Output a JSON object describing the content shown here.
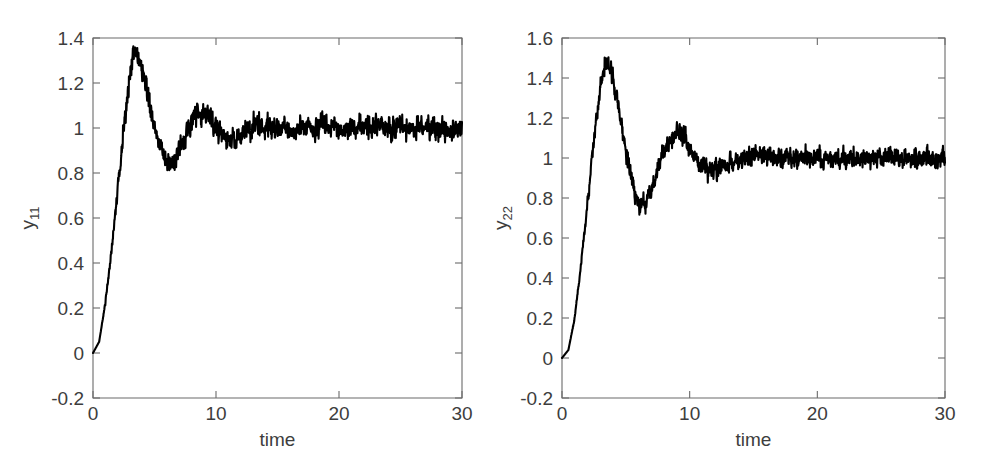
{
  "figure": {
    "background": "#ffffff",
    "curve_color": "#000000",
    "axis_color": "#6b6b6b",
    "text_color": "#3d3d3d",
    "width": 983,
    "height": 459
  },
  "panels": [
    {
      "name": "panel-y11",
      "ylabel_base": "y",
      "ylabel_sub": "11",
      "xlabel": "time",
      "x_ticks": [
        "0",
        "10",
        "20",
        "30"
      ],
      "y_ticks": [
        "-0.2",
        "0",
        "0.2",
        "0.4",
        "0.6",
        "0.8",
        "1",
        "1.2",
        "1.4"
      ]
    },
    {
      "name": "panel-y22",
      "ylabel_base": "y",
      "ylabel_sub": "22",
      "xlabel": "time",
      "x_ticks": [
        "0",
        "10",
        "20",
        "30"
      ],
      "y_ticks": [
        "-0.2",
        "0",
        "0.2",
        "0.4",
        "0.6",
        "0.8",
        "1",
        "1.2",
        "1.4",
        "1.6"
      ]
    }
  ],
  "chart_data": [
    {
      "type": "line",
      "title": "",
      "xlabel": "time",
      "ylabel": "y11",
      "xlim": [
        0,
        30
      ],
      "ylim": [
        -0.2,
        1.4
      ],
      "xticks": [
        0,
        10,
        20,
        30
      ],
      "yticks": [
        -0.2,
        0,
        0.2,
        0.4,
        0.6,
        0.8,
        1.0,
        1.2,
        1.4
      ],
      "grid": false,
      "legend": "none",
      "description": "Noisy step response of a closed-loop system, damped oscillation settling to 1",
      "model": {
        "steady_state": 1.0,
        "overshoot_peak": 1.34,
        "peak_time": 3.3,
        "first_trough": 0.85,
        "trough_time": 6.1,
        "second_peak": 1.08,
        "second_peak_time": 8.8,
        "damping_ratio": 0.31,
        "natural_frequency": 1.1,
        "dead_time": 0.35,
        "noise_amplitude": 0.05,
        "settled_band": [
          0.95,
          1.05
        ]
      },
      "x": [
        0,
        0.5,
        1,
        1.5,
        2,
        2.5,
        3,
        3.3,
        3.5,
        4,
        4.5,
        5,
        5.5,
        6,
        6.1,
        6.5,
        7,
        7.5,
        8,
        8.5,
        8.8,
        9,
        9.5,
        10,
        10.5,
        11,
        11.5,
        12,
        12.5,
        13,
        14,
        15,
        16,
        17,
        18,
        19,
        20,
        22,
        24,
        26,
        28,
        30
      ],
      "y": [
        0.0,
        0.05,
        0.22,
        0.45,
        0.72,
        1.0,
        1.25,
        1.34,
        1.33,
        1.26,
        1.13,
        1.0,
        0.91,
        0.86,
        0.85,
        0.86,
        0.9,
        0.97,
        1.03,
        1.07,
        1.08,
        1.07,
        1.04,
        1.0,
        0.97,
        0.95,
        0.95,
        0.96,
        0.98,
        1.0,
        1.01,
        1.0,
        0.99,
        1.0,
        1.0,
        1.0,
        1.0,
        1.0,
        1.0,
        1.0,
        1.0,
        1.0
      ]
    },
    {
      "type": "line",
      "title": "",
      "xlabel": "time",
      "ylabel": "y22",
      "xlim": [
        0,
        30
      ],
      "ylim": [
        -0.2,
        1.6
      ],
      "xticks": [
        0,
        10,
        20,
        30
      ],
      "yticks": [
        -0.2,
        0,
        0.2,
        0.4,
        0.6,
        0.8,
        1.0,
        1.2,
        1.4,
        1.6
      ],
      "grid": false,
      "legend": "none",
      "description": "Noisy step response of a closed-loop system, damped oscillation settling to 1",
      "model": {
        "steady_state": 1.0,
        "overshoot_peak": 1.49,
        "peak_time": 3.4,
        "first_trough": 0.76,
        "trough_time": 6.3,
        "second_peak": 1.13,
        "second_peak_time": 9.2,
        "damping_ratio": 0.24,
        "natural_frequency": 1.08,
        "dead_time": 0.3,
        "noise_amplitude": 0.05,
        "settled_band": [
          0.95,
          1.05
        ]
      },
      "x": [
        0,
        0.5,
        1,
        1.5,
        2,
        2.5,
        3,
        3.4,
        3.6,
        4,
        4.5,
        5,
        5.5,
        6,
        6.3,
        6.8,
        7.2,
        7.8,
        8.4,
        9,
        9.2,
        9.6,
        10,
        10.5,
        11,
        11.5,
        12,
        12.5,
        13,
        14,
        15,
        16,
        17,
        18,
        19,
        20,
        22,
        24,
        26,
        28,
        30
      ],
      "y": [
        0.0,
        0.04,
        0.2,
        0.47,
        0.78,
        1.09,
        1.36,
        1.49,
        1.48,
        1.4,
        1.22,
        1.03,
        0.88,
        0.78,
        0.76,
        0.8,
        0.88,
        1.0,
        1.09,
        1.13,
        1.13,
        1.1,
        1.05,
        0.99,
        0.95,
        0.93,
        0.93,
        0.95,
        0.97,
        1.0,
        1.02,
        1.01,
        1.0,
        1.0,
        1.0,
        1.0,
        1.0,
        1.0,
        1.0,
        1.0,
        1.0
      ]
    }
  ]
}
